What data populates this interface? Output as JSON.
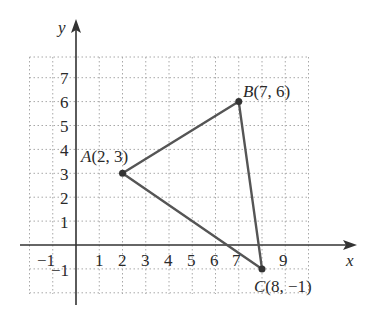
{
  "axes": {
    "x_label": "x",
    "y_label": "y",
    "x_ticks": [
      "−1",
      "1",
      "2",
      "3",
      "4",
      "5",
      "6",
      "7",
      "9"
    ],
    "y_ticks": [
      "7",
      "6",
      "5",
      "4",
      "3",
      "2",
      "1",
      "−1"
    ]
  },
  "points": {
    "A": {
      "name": "A",
      "coords": "(2, 3)",
      "x": 2,
      "y": 3
    },
    "B": {
      "name": "B",
      "coords": "(7, 6)",
      "x": 7,
      "y": 6
    },
    "C": {
      "name": "C",
      "coords": "(8, −1)",
      "x": 8,
      "y": -1
    }
  },
  "colors": {
    "triangle": "#555555",
    "grid": "#aaaaaa",
    "axis": "#333333"
  }
}
